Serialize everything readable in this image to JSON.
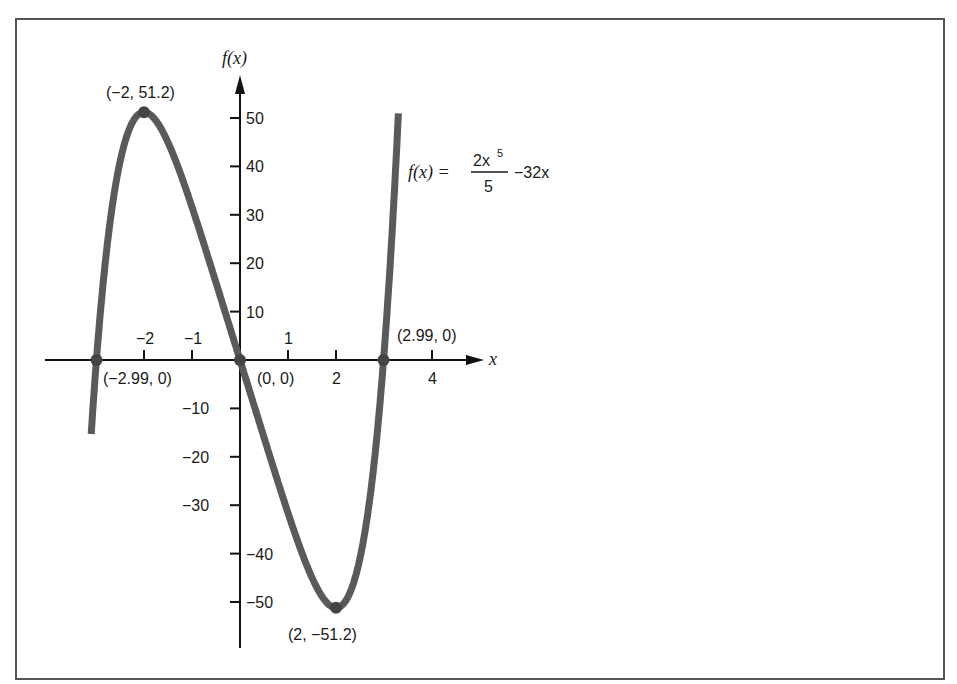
{
  "chart_data": {
    "type": "line",
    "title": "",
    "function_label": {
      "lhs": "f(x) =",
      "numerator": "2x",
      "exponent": "5",
      "denominator": "5",
      "tail": "−32x"
    },
    "xlabel": "x",
    "ylabel": "f(x)",
    "xlim": [
      -3.2,
      5.2
    ],
    "ylim": [
      -56,
      56
    ],
    "x_ticks": [
      -2,
      -1,
      1,
      2,
      4
    ],
    "x_tick_labels": [
      "−2",
      "−1",
      "1",
      "2",
      "4"
    ],
    "y_ticks": [
      50,
      40,
      30,
      20,
      10,
      -10,
      -20,
      -30,
      -40,
      -50
    ],
    "y_tick_labels": [
      "50",
      "40",
      "30",
      "20",
      "10",
      "−10",
      "−20",
      "−30",
      "−40",
      "−50"
    ],
    "grid": false,
    "series": [
      {
        "name": "f(x) = 2x^5/5 - 32x",
        "formula": "2*x^5/5 - 32*x",
        "x_range": [
          -3.1,
          3.3
        ],
        "color": "#5a5a5a"
      }
    ],
    "annotations": [
      {
        "label": "(−2, 51.2)",
        "x": -2,
        "y": 51.2
      },
      {
        "label": "(2, −51.2)",
        "x": 2,
        "y": -51.2
      },
      {
        "label": "(−2.99, 0)",
        "x": -2.99,
        "y": 0
      },
      {
        "label": "(0, 0)",
        "x": 0,
        "y": 0
      },
      {
        "label": "(2.99, 0)",
        "x": 2.99,
        "y": 0
      }
    ]
  },
  "colors": {
    "curve": "#5a5a5a",
    "axis": "#111111",
    "frame": "#555555",
    "text": "#1a1a1a"
  }
}
